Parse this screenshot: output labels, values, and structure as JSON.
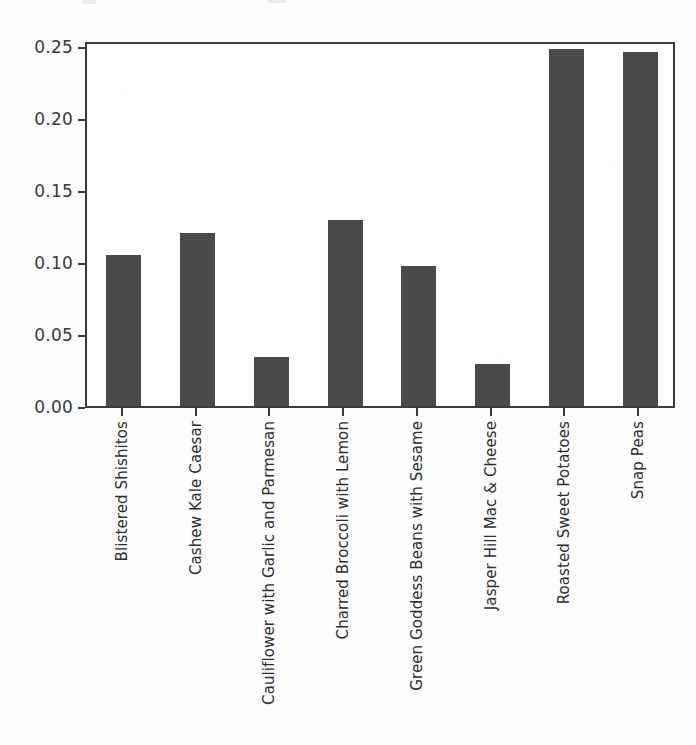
{
  "chart_data": {
    "type": "bar",
    "title": "",
    "subtitle": "",
    "xlabel": "",
    "ylabel": "",
    "categories": [
      "Blistered Shishitos",
      "Cashew Kale Caesar",
      "Cauliflower with Garlic and Parmesan",
      "Charred Broccoli with Lemon",
      "Green Goddess Beans with Sesame",
      "Jasper Hill Mac & Cheese",
      "Roasted Sweet Potatoes",
      "Snap Peas"
    ],
    "values": [
      0.105,
      0.12,
      0.034,
      0.129,
      0.097,
      0.029,
      0.248,
      0.246
    ],
    "ylim": [
      0.0,
      0.254
    ],
    "yticks": [
      0.0,
      0.05,
      0.1,
      0.15,
      0.2,
      0.25
    ],
    "ytick_labels": [
      "0.00",
      "0.05",
      "0.10",
      "0.15",
      "0.20",
      "0.25"
    ],
    "grid": false,
    "legend": false,
    "bar_color": "#4a4a4a",
    "axis_color": "#3c3c3c",
    "background_color": "#ffffff",
    "xtick_rotation": 90
  }
}
